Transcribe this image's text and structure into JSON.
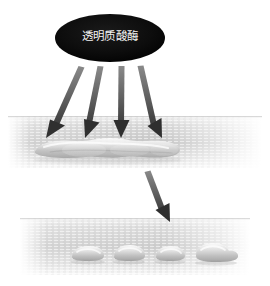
{
  "figure": {
    "background_color": "#ffffff",
    "width": 270,
    "height": 286
  },
  "enzyme_node": {
    "label": "透明质酸酶",
    "shape": "ellipse",
    "fill_color": "#0b0b0b",
    "text_color": "#f2f2f2",
    "center_x": 110,
    "center_y": 38,
    "radius_x": 55,
    "radius_y": 24
  },
  "arrows": {
    "fan_color": "#5a5a5a",
    "fan_count": 4,
    "fan_label": "enzyme-action-arrows",
    "single_color": "#6a6a6a",
    "single_label": "transformation-arrow"
  },
  "upper_band": {
    "name": "tissue-band-before",
    "caption": "",
    "fill_light": "#f7f7f7",
    "fill_mid": "#c9c9c9",
    "top": 116,
    "bottom": 168,
    "lesion_label": "continuous-filler-deposit",
    "lesion_count": 1
  },
  "lower_band": {
    "name": "tissue-band-after",
    "caption": "",
    "fill_light": "#f7f7f7",
    "fill_mid": "#cfcfcf",
    "top": 218,
    "bottom": 275,
    "nodule_label": "dispersed-filler-nodules",
    "nodule_count": 4
  }
}
